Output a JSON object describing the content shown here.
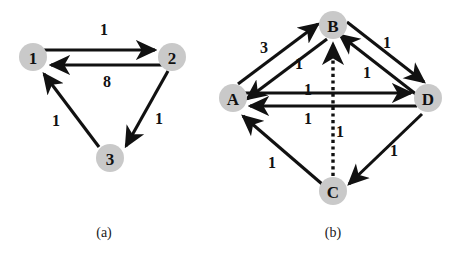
{
  "figure": {
    "background_color": "#ffffff",
    "node_fill_color": "#c9c9c9",
    "edge_color": "#111111",
    "panels": [
      {
        "id": "panel-a",
        "caption": "(a)",
        "caption_x": 104,
        "caption_y": 232,
        "nodes": [
          {
            "id": "n1",
            "label": "1",
            "cx": 33,
            "cy": 57,
            "r": 14
          },
          {
            "id": "n2",
            "label": "2",
            "cx": 172,
            "cy": 57,
            "r": 14
          },
          {
            "id": "n3",
            "label": "3",
            "cx": 110,
            "cy": 158,
            "r": 14
          }
        ],
        "edges": [
          {
            "id": "e-1-2",
            "from": "1",
            "to": "2",
            "weight": "1",
            "style": "solid",
            "label_x": 104,
            "label_y": 29
          },
          {
            "id": "e-2-1",
            "from": "2",
            "to": "1",
            "weight": "8",
            "style": "solid",
            "label_x": 107,
            "label_y": 81
          },
          {
            "id": "e-2-3",
            "from": "2",
            "to": "3",
            "weight": "1",
            "style": "solid",
            "label_x": 159,
            "label_y": 118
          },
          {
            "id": "e-3-1",
            "from": "3",
            "to": "1",
            "weight": "1",
            "style": "solid",
            "label_x": 56,
            "label_y": 120
          }
        ]
      },
      {
        "id": "panel-b",
        "caption": "(b)",
        "caption_x": 333,
        "caption_y": 232,
        "nodes": [
          {
            "id": "nB",
            "label": "B",
            "cx": 333,
            "cy": 25,
            "r": 14
          },
          {
            "id": "nA",
            "label": "A",
            "cx": 233,
            "cy": 98,
            "r": 14
          },
          {
            "id": "nD",
            "label": "D",
            "cx": 428,
            "cy": 98,
            "r": 14
          },
          {
            "id": "nC",
            "label": "C",
            "cx": 333,
            "cy": 191,
            "r": 14
          }
        ],
        "edges": [
          {
            "id": "e-A-B",
            "from": "A",
            "to": "B",
            "weight": "3",
            "style": "solid",
            "label_x": 264,
            "label_y": 47
          },
          {
            "id": "e-B-A",
            "from": "B",
            "to": "A",
            "weight": "1",
            "style": "solid",
            "label_x": 299,
            "label_y": 63
          },
          {
            "id": "e-B-D",
            "from": "B",
            "to": "D",
            "weight": "1",
            "style": "solid",
            "label_x": 387,
            "label_y": 42
          },
          {
            "id": "e-D-B",
            "from": "D",
            "to": "B",
            "weight": "1",
            "style": "solid",
            "label_x": 367,
            "label_y": 72
          },
          {
            "id": "e-A-D",
            "from": "A",
            "to": "D",
            "weight": "1",
            "style": "solid",
            "label_x": 308,
            "label_y": 89
          },
          {
            "id": "e-D-A",
            "from": "D",
            "to": "A",
            "weight": "1",
            "style": "solid",
            "label_x": 308,
            "label_y": 118
          },
          {
            "id": "e-C-B",
            "from": "C",
            "to": "B",
            "weight": "1",
            "style": "dotted",
            "label_x": 340,
            "label_y": 131
          },
          {
            "id": "e-C-A",
            "from": "C",
            "to": "A",
            "weight": "1",
            "style": "solid",
            "label_x": 272,
            "label_y": 162
          },
          {
            "id": "e-D-C",
            "from": "D",
            "to": "C",
            "weight": "1",
            "style": "solid",
            "label_x": 394,
            "label_y": 150
          }
        ]
      }
    ]
  }
}
